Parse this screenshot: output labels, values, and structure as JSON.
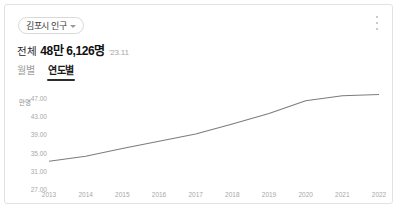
{
  "card": {
    "chip": {
      "label": "김포시 인구",
      "icon": "chevron-down-icon"
    },
    "menu_icon": "kebab-menu-icon",
    "stat": {
      "prefix": "전체",
      "value": "48만 6,126명",
      "date": "'23.11"
    },
    "tabs": [
      {
        "label": "월별",
        "active": false
      },
      {
        "label": "연도별",
        "active": true
      }
    ]
  },
  "chart_data": {
    "type": "line",
    "title": "",
    "xlabel": "",
    "ylabel": "만명",
    "unit": "만명",
    "categories": [
      "2013",
      "2014",
      "2015",
      "2016",
      "2017",
      "2018",
      "2019",
      "2020",
      "2021",
      "2022"
    ],
    "values": [
      33.1,
      34.2,
      35.9,
      37.5,
      39.1,
      41.3,
      43.6,
      46.4,
      47.5,
      47.8
    ],
    "series": [
      {
        "name": "김포시 인구",
        "values": [
          33.1,
          34.2,
          35.9,
          37.5,
          39.1,
          41.3,
          43.6,
          46.4,
          47.5,
          47.8
        ]
      }
    ],
    "yticks": [
      "47.00",
      "43.00",
      "39.00",
      "35.00",
      "31.00",
      "27.00"
    ],
    "ytick_values": [
      47,
      43,
      39,
      35,
      31,
      27
    ],
    "ylim": [
      27,
      49
    ],
    "grid": false,
    "legend": "none",
    "line_color": "#7c7c7c"
  }
}
